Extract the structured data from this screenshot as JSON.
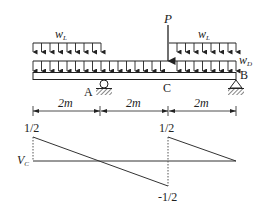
{
  "diagram": {
    "type": "beam-shear-influence",
    "loads": {
      "distributed_live_left": {
        "label": "w",
        "subscript": "L"
      },
      "distributed_live_right": {
        "label": "w",
        "subscript": "L"
      },
      "distributed_dead": {
        "label": "w",
        "subscript": "D"
      },
      "point_load": {
        "label": "P"
      }
    },
    "points": {
      "A": "A",
      "B": "B",
      "C": "C"
    },
    "dimensions": [
      "2m",
      "2m",
      "2m"
    ],
    "shear_diagram": {
      "variable": {
        "label": "V",
        "subscript": "C"
      },
      "values": {
        "left_top": "1/2",
        "mid_top": "1/2",
        "mid_bottom": "-1/2"
      }
    }
  }
}
